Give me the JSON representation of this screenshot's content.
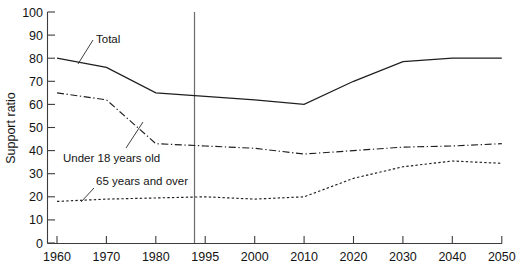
{
  "chart_data": {
    "type": "line",
    "title": "",
    "xlabel": "",
    "ylabel": "Support ratio",
    "ylim": [
      0,
      100
    ],
    "ytick_labels": [
      "0",
      "10",
      "20",
      "30",
      "40",
      "50",
      "60",
      "70",
      "80",
      "90",
      "100"
    ],
    "yticks": [
      0,
      10,
      20,
      30,
      40,
      50,
      60,
      70,
      80,
      90,
      100
    ],
    "categories": [
      "1960",
      "1970",
      "1980",
      "1995",
      "2000",
      "2010",
      "2020",
      "2030",
      "2040",
      "2050"
    ],
    "grid": false,
    "legend_position": "inline-annotations",
    "series": [
      {
        "name": "Total",
        "style": "solid",
        "values": [
          80,
          76,
          65,
          63.5,
          62,
          60,
          70,
          78.5,
          80,
          80
        ]
      },
      {
        "name": "Under 18 years old",
        "style": "dash-dot",
        "values": [
          65,
          62,
          43,
          42,
          41,
          38.5,
          40,
          41.5,
          42,
          43
        ]
      },
      {
        "name": "65 years and over",
        "style": "dotted",
        "values": [
          18,
          19,
          19.5,
          20,
          19,
          20,
          28,
          33,
          35.5,
          34.5
        ]
      }
    ],
    "annotations": [
      {
        "text": "Total",
        "series": "Total"
      },
      {
        "text": "Under 18 years old",
        "series": "Under 18 years old"
      },
      {
        "text": "65 years and over",
        "series": "65 years and over"
      }
    ],
    "reference_line": {
      "at_category": "1995",
      "orientation": "vertical",
      "label": ""
    },
    "colors": {
      "ink": "#1f1f1f",
      "axis": "#3c3c3c",
      "divider": "#6b6b6b",
      "background": "#ffffff"
    }
  }
}
